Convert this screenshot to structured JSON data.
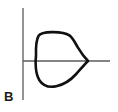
{
  "figure": {
    "panel_label": "B",
    "background_color": "#ffffff",
    "axis_color": "#5a5a5a",
    "curve_color": "#111111",
    "label_color": "#1a1a1a",
    "axes": {
      "vertical_axis_name": "vertical-axis",
      "horizontal_axis_name": "horizontal-axis",
      "origin_x": 23,
      "origin_y": 61,
      "vertical_axis_top": 8,
      "vertical_axis_bottom": 100,
      "horizontal_axis_left": 23,
      "horizontal_axis_right": 110,
      "tick_labels": [],
      "axis_titles": []
    }
  },
  "chart_data": {
    "type": "line",
    "title": "",
    "subtitle": "",
    "xlabel": "",
    "ylabel": "",
    "xlim": [
      0,
      118
    ],
    "ylim": [
      112,
      0
    ],
    "grid": false,
    "legend": null,
    "annotations": [
      {
        "text": "B",
        "x": 6,
        "y": 100,
        "bold": true
      }
    ],
    "series": [
      {
        "name": "closed-curve",
        "closed": true,
        "fill": "none",
        "stroke_width": 2.6,
        "points": [
          [
            36,
            56
          ],
          [
            36,
            44
          ],
          [
            36.5,
            37
          ],
          [
            39,
            33.5
          ],
          [
            44,
            32.5
          ],
          [
            55,
            32.2
          ],
          [
            64,
            33
          ],
          [
            69,
            35
          ],
          [
            73,
            40
          ],
          [
            78,
            48
          ],
          [
            83,
            55
          ],
          [
            88,
            61
          ],
          [
            83,
            66
          ],
          [
            78,
            72
          ],
          [
            72,
            79
          ],
          [
            64,
            84
          ],
          [
            56,
            86.5
          ],
          [
            48,
            86
          ],
          [
            42,
            83
          ],
          [
            38,
            77
          ],
          [
            36,
            69
          ],
          [
            35.7,
            62
          ],
          [
            36,
            56
          ]
        ]
      },
      {
        "name": "vertical-axis-line",
        "closed": false,
        "fill": "none",
        "stroke_width": 1.2,
        "points": [
          [
            23,
            8
          ],
          [
            23,
            100
          ]
        ]
      },
      {
        "name": "horizontal-axis-line",
        "closed": false,
        "fill": "none",
        "stroke_width": 1.2,
        "points": [
          [
            23,
            61
          ],
          [
            110,
            61
          ]
        ]
      }
    ]
  }
}
